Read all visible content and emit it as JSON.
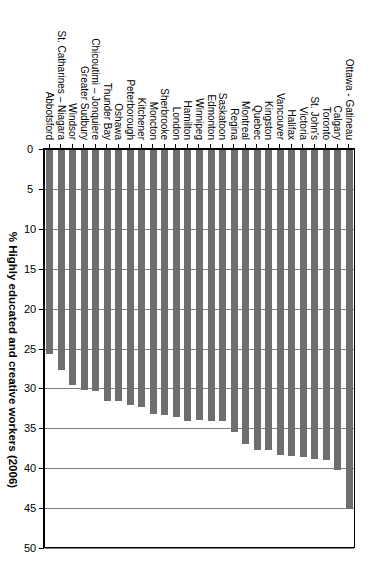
{
  "chart_data": {
    "type": "bar",
    "orientation": "horizontal",
    "title": "",
    "xlabel": "% Highly educated and creative workers (2006)",
    "ylabel": "",
    "xlim": [
      0,
      50
    ],
    "xticks": [
      0,
      5,
      10,
      15,
      20,
      25,
      30,
      35,
      40,
      45,
      50
    ],
    "grid": true,
    "legend": null,
    "bar_color": "#6e6e6e",
    "categories": [
      "Ottawa - Gatineau",
      "Calgary",
      "Toronto",
      "St. John's",
      "Victoria",
      "Halifax",
      "Vancouver",
      "Kingston",
      "Quebec",
      "Montreal",
      "Regina",
      "Saskatoon",
      "Edmonton",
      "Winnipeg",
      "Hamilton",
      "London",
      "Sherbrooke",
      "Moncton",
      "Kitchener",
      "Peterborough",
      "Oshawa",
      "Thunder Bay",
      "Chicoutimi – Jonquiere",
      "Greater Sudbury",
      "Windsor",
      "St. Catharines – Niagara",
      "Abbotsford"
    ],
    "values": [
      45.0,
      40.1,
      38.8,
      38.7,
      38.5,
      38.3,
      38.2,
      37.6,
      37.6,
      36.8,
      35.4,
      34.0,
      33.9,
      33.8,
      33.9,
      33.4,
      33.2,
      33.1,
      32.2,
      32.0,
      31.5,
      31.4,
      30.2,
      30.1,
      29.5,
      27.6,
      25.6
    ]
  },
  "axis": {
    "tick_labels": [
      "0",
      "5",
      "10",
      "15",
      "20",
      "25",
      "30",
      "35",
      "40",
      "45",
      "50"
    ],
    "title": "% Highly educated and creative workers (2006)"
  }
}
